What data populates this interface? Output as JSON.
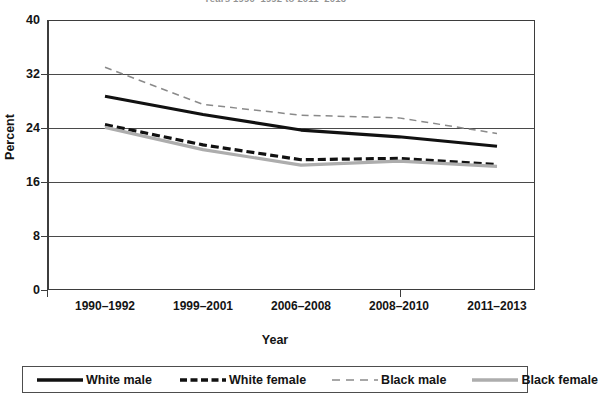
{
  "chart_data": {
    "type": "line",
    "title": "Years 1990–1992 to 2011–2013",
    "xlabel": "Year",
    "ylabel": "Percent",
    "categories": [
      "1990–1992",
      "1999–2001",
      "2006–2008",
      "2008–2010",
      "2011–2013"
    ],
    "ylim": [
      0,
      40
    ],
    "yticks": [
      0,
      8,
      16,
      24,
      32,
      40
    ],
    "ytick_labels": [
      "0",
      "8",
      "16",
      "24",
      "32",
      "40"
    ],
    "grid": true,
    "legend_position": "bottom",
    "series": [
      {
        "name": "White male",
        "values": [
          28.7,
          26.0,
          23.7,
          22.7,
          21.3
        ],
        "color": "#111111",
        "style": "solid",
        "width": 3.2
      },
      {
        "name": "White female",
        "values": [
          24.5,
          21.5,
          19.3,
          19.5,
          18.6
        ],
        "color": "#111111",
        "style": "dashed",
        "width": 3.2
      },
      {
        "name": "Black male",
        "values": [
          33.0,
          27.5,
          25.9,
          25.5,
          23.2
        ],
        "color": "#8a8a8a",
        "style": "dashed",
        "width": 1.5
      },
      {
        "name": "Black female",
        "values": [
          24.1,
          20.8,
          18.5,
          19.1,
          18.3
        ],
        "color": "#adadad",
        "style": "solid",
        "width": 3.2
      }
    ]
  },
  "axes": {
    "y_title": "Percent",
    "x_title": "Year",
    "y_tick_labels": [
      "40",
      "32",
      "24",
      "16",
      "8",
      "0"
    ],
    "x_tick_labels": [
      "1990–1992",
      "1999–2001",
      "2006–2008",
      "2008–2010",
      "2011–2013"
    ]
  },
  "legend": {
    "items": [
      {
        "label": "White male",
        "swatch": "solid-black-thick"
      },
      {
        "label": "White female",
        "swatch": "dashed-black-thick"
      },
      {
        "label": "Black male",
        "swatch": "dashed-gray-thin"
      },
      {
        "label": "Black female",
        "swatch": "solid-gray-thick"
      }
    ]
  }
}
